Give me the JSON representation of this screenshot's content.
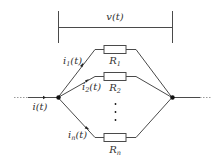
{
  "diagram": {
    "voltage_label": "v(t)",
    "input_current_label": "i(t)",
    "branches": [
      {
        "current_label": "i",
        "current_sub": "1",
        "current_arg": "(t)",
        "resistor_label": "R",
        "resistor_sub": "1"
      },
      {
        "current_label": "i",
        "current_sub": "2",
        "current_arg": "(t)",
        "resistor_label": "R",
        "resistor_sub": "2"
      },
      {
        "current_label": "i",
        "current_sub": "n",
        "current_arg": "(t)",
        "resistor_label": "R",
        "resistor_sub": "n"
      }
    ],
    "ellipsis": "⋮",
    "colors": {
      "wire": "#4a4a4a",
      "node": "#111111",
      "text": "#333333"
    }
  }
}
